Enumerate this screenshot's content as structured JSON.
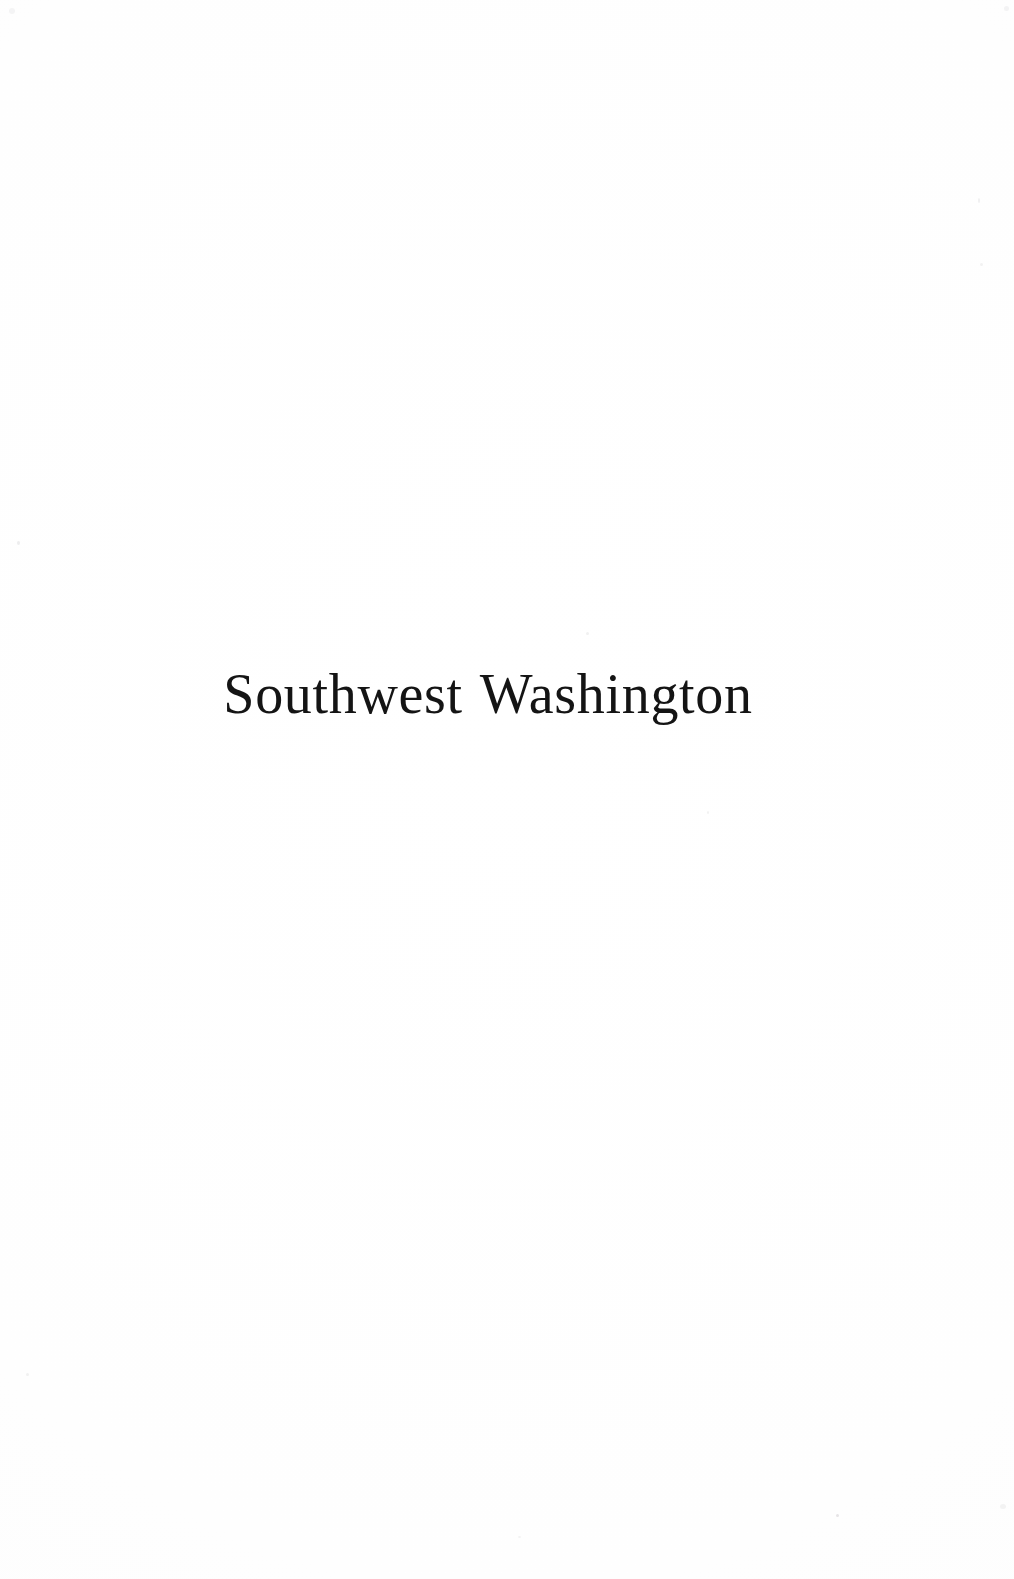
{
  "page": {
    "kind": "scanned-book-half-title-page",
    "width_px": 1014,
    "height_px": 1579,
    "background_color": "#fefefe",
    "ink_color": "#141414"
  },
  "content": {
    "half_title": "Southwest Washington"
  },
  "typography": {
    "family_style": "old-style serif",
    "weight": "regular",
    "font_size_px": 56,
    "alignment": "center",
    "baseline_y_px": 721,
    "text_left_px": 253,
    "text_right_px": 723,
    "text_center_x_px": 488
  },
  "artifacts": {
    "description": "faint scanner dust specks on otherwise blank paper",
    "specks": [
      {
        "x": 17,
        "y": 541
      },
      {
        "x": 836,
        "y": 1514
      },
      {
        "x": 586,
        "y": 632
      },
      {
        "x": 707,
        "y": 811
      },
      {
        "x": 978,
        "y": 198
      },
      {
        "x": 980,
        "y": 263
      },
      {
        "x": 26,
        "y": 1373
      },
      {
        "x": 9,
        "y": 8
      },
      {
        "x": 1004,
        "y": 6
      },
      {
        "x": 1000,
        "y": 1504
      },
      {
        "x": 518,
        "y": 1536
      }
    ]
  }
}
